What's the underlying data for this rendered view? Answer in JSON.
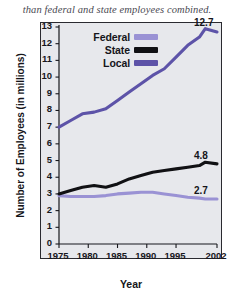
{
  "caption": "than federal and state employees combined.",
  "legend": {
    "entries": [
      {
        "label": "Federal",
        "color": "#9a92d4"
      },
      {
        "label": "State",
        "color": "#111114"
      },
      {
        "label": "Local",
        "color": "#5d53a8"
      }
    ]
  },
  "axes": {
    "y_title": "Number of Employees (in millions)",
    "x_title": "Year",
    "y_ticks": [
      "0",
      "1",
      "2",
      "3",
      "4",
      "5",
      "6",
      "7",
      "8",
      "9",
      "10",
      "11",
      "12",
      "13"
    ],
    "x_ticks": [
      "1975",
      "1980",
      "1985",
      "1990",
      "1995",
      "2002"
    ]
  },
  "end_labels": {
    "local": "12.7",
    "state": "4.8",
    "federal": "2.7"
  },
  "chart_data": {
    "type": "line",
    "title": "",
    "xlabel": "Year",
    "ylabel": "Number of Employees (in millions)",
    "xlim": [
      1975,
      2002
    ],
    "ylim": [
      0,
      13
    ],
    "x": [
      1975,
      1977,
      1979,
      1981,
      1983,
      1985,
      1987,
      1989,
      1991,
      1993,
      1995,
      1997,
      1999,
      2000,
      2002
    ],
    "grid": false,
    "legend_position": "top-left",
    "series": [
      {
        "name": "Federal",
        "color": "#9a92d4",
        "values": [
          2.9,
          2.85,
          2.85,
          2.85,
          2.9,
          3.0,
          3.05,
          3.1,
          3.1,
          3.0,
          2.9,
          2.8,
          2.75,
          2.7,
          2.7
        ],
        "end_label": "2.7"
      },
      {
        "name": "State",
        "color": "#111114",
        "values": [
          3.0,
          3.2,
          3.4,
          3.5,
          3.4,
          3.6,
          3.9,
          4.1,
          4.3,
          4.4,
          4.5,
          4.6,
          4.7,
          4.9,
          4.8
        ],
        "end_label": "4.8"
      },
      {
        "name": "Local",
        "color": "#5d53a8",
        "values": [
          7.0,
          7.4,
          7.8,
          7.9,
          8.1,
          8.6,
          9.1,
          9.6,
          10.1,
          10.5,
          11.2,
          11.9,
          12.4,
          12.9,
          12.7
        ],
        "end_label": "12.7"
      }
    ]
  }
}
